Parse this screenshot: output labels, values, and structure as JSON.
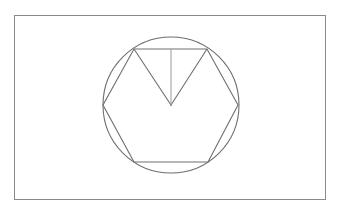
{
  "diagram": {
    "colors": {
      "background": "#ffffff",
      "frame": "#8a8a8a",
      "lines": "#6e6e6e",
      "radius_line": "#9a9a9a"
    },
    "frame": {
      "x": 14,
      "y": 15,
      "width": 311,
      "height": 184
    },
    "circle": {
      "cx": 171,
      "cy": 105,
      "r": 68
    },
    "hexagon": {
      "vertices": [
        [
          134,
          49
        ],
        [
          207,
          49
        ],
        [
          238,
          105
        ],
        [
          208,
          162
        ],
        [
          134,
          162
        ],
        [
          103,
          105
        ]
      ]
    },
    "triangle": {
      "vertices": [
        [
          134,
          49
        ],
        [
          171,
          105
        ],
        [
          207,
          49
        ]
      ]
    },
    "radius_line": {
      "x1": 171,
      "y1": 49,
      "x2": 171,
      "y2": 105
    },
    "center": {
      "x": 171,
      "y": 105
    }
  }
}
